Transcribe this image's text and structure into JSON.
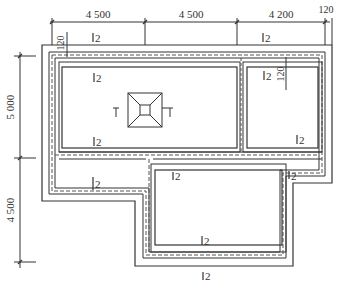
{
  "drawing": {
    "type": "foundation plan",
    "top_dimensions": [
      "4 500",
      "4 500",
      "4 200",
      "120"
    ],
    "left_dimensions": [
      "5 000",
      "4 500"
    ],
    "inner_offsets": [
      "120",
      "120"
    ],
    "section_marks": {
      "label": "2",
      "count": 9
    },
    "pedestal_section_marks": [
      "1",
      "1"
    ],
    "line_color": "#333333",
    "background": "#ffffff"
  }
}
